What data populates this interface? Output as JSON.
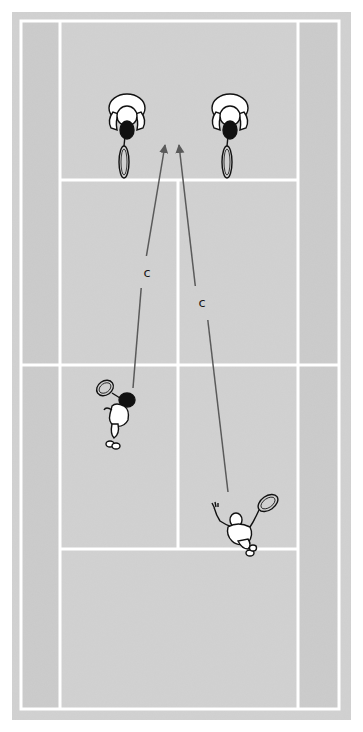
{
  "diagram": {
    "type": "tennis-doubles-court-top-view",
    "colors": {
      "page_background": "#ffffff",
      "court_surface": "#cfcfcf",
      "alley_surface": "#c9c9c9",
      "court_lines": "#ffffff",
      "arrow": "#5a5a5a",
      "label_text": "#1a1a1a",
      "player_outline": "#111111",
      "player_fill": "#ffffff"
    },
    "court": {
      "surface_rect": {
        "x": 12,
        "y": 12,
        "w": 339,
        "h": 708
      },
      "outer_lines": {
        "left": 21,
        "right": 339,
        "top": 21,
        "bottom": 709
      },
      "singles_lines": {
        "left": 60,
        "right": 298
      },
      "service_lines": {
        "top": 180,
        "bottom": 549
      },
      "net_line": 365,
      "center_service_x": 178
    },
    "players": [
      {
        "id": "far-left-player",
        "x": 127,
        "y": 118,
        "facing": "away"
      },
      {
        "id": "far-right-player",
        "x": 230,
        "y": 118,
        "facing": "away"
      },
      {
        "id": "near-left-player",
        "x": 118,
        "y": 412,
        "facing": "toward-net-hitting"
      },
      {
        "id": "near-right-player",
        "x": 242,
        "y": 525,
        "facing": "toward-net-serving"
      }
    ],
    "arrows": [
      {
        "id": "arrow-left",
        "from": [
          133,
          388
        ],
        "to": [
          165,
          145
        ],
        "gap_from_y": 288,
        "gap_to_y": 256,
        "label": "c",
        "label_pos": [
          147,
          272
        ]
      },
      {
        "id": "arrow-right",
        "from": [
          228,
          492
        ],
        "to": [
          179,
          145
        ],
        "gap_from_y": 320,
        "gap_to_y": 286,
        "label": "c",
        "label_pos": [
          202,
          302
        ]
      }
    ]
  }
}
